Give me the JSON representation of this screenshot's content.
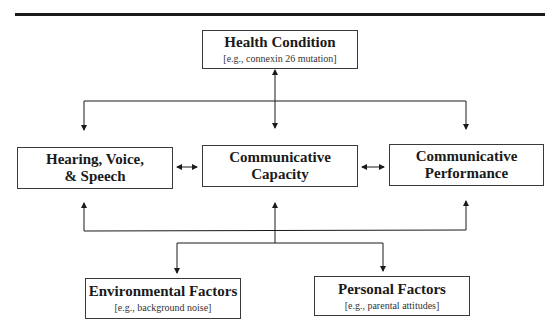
{
  "diagram": {
    "health_condition": {
      "title": "Health Condition",
      "example": "[e.g., connexin 26 mutation]"
    },
    "middle_row": [
      {
        "title_line1": "Hearing, Voice,",
        "title_line2": "& Speech"
      },
      {
        "title_line1": "Communicative",
        "title_line2": "Capacity"
      },
      {
        "title_line1": "Communicative",
        "title_line2": "Performance"
      }
    ],
    "environmental_factors": {
      "title": "Environmental Factors",
      "example": "[e.g., background noise]"
    },
    "personal_factors": {
      "title": "Personal Factors",
      "example": "[e.g., parental attitudes]"
    }
  },
  "colors": {
    "line": "#1a1a1a",
    "box_border": "#3a3a3a",
    "background": "#ffffff"
  }
}
